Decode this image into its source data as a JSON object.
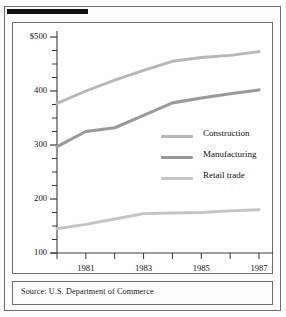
{
  "figure": {
    "source_note": "Source: U.S. Department of Commerce"
  },
  "chart_data": {
    "type": "line",
    "title": "",
    "xlabel": "",
    "ylabel": "",
    "x": [
      1980,
      1981,
      1982,
      1983,
      1984,
      1985,
      1986,
      1987
    ],
    "xtick_labels": [
      "",
      "1981",
      "",
      "1983",
      "",
      "1985",
      "",
      "1987"
    ],
    "ytick_labels": [
      "$500",
      "400",
      "300",
      "200",
      "100"
    ],
    "ytick_values": [
      500,
      400,
      300,
      200,
      100
    ],
    "ylim": [
      100,
      500
    ],
    "xlim": [
      1980,
      1987
    ],
    "y_minor_tick_step": 25,
    "grid": false,
    "legend_position": "center-right",
    "units_note": "billions of dollars",
    "series": [
      {
        "name": "Construction",
        "color": "#b7b7b7",
        "values": [
          377,
          400,
          420,
          438,
          455,
          462,
          466,
          473
        ]
      },
      {
        "name": "Manufacturing",
        "color": "#9a9a9a",
        "values": [
          297,
          325,
          332,
          355,
          378,
          387,
          395,
          402
        ]
      },
      {
        "name": "Retail trade",
        "color": "#c4c4c4",
        "values": [
          145,
          153,
          163,
          173,
          174,
          175,
          178,
          180
        ]
      }
    ]
  },
  "legend": {
    "items": [
      {
        "label": "Construction"
      },
      {
        "label": "Manufacturing"
      },
      {
        "label": "Retail  trade"
      }
    ]
  },
  "colors": {
    "axis": "#3a3a3a",
    "frame": "#6e6e6e",
    "text": "#141414",
    "rule": "#111111"
  }
}
